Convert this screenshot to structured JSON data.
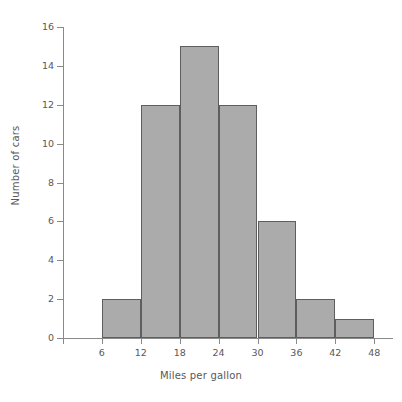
{
  "chart_data": {
    "type": "bar",
    "title": "",
    "subtitle": "",
    "xlabel": "Miles per gallon",
    "ylabel": "Number of cars",
    "bin_edges": [
      6,
      12,
      18,
      24,
      30,
      36,
      42,
      48
    ],
    "categories": [
      "6-12",
      "12-18",
      "18-24",
      "24-30",
      "30-36",
      "36-42",
      "42-48"
    ],
    "values": [
      2,
      12,
      15,
      12,
      6,
      2,
      1
    ],
    "bar_color": "#ababab",
    "bar_edge_color": "#5e5e5e",
    "axis_color": "#8a8a8a",
    "text_color": "#58585a",
    "background": "#ffffff",
    "grid": false,
    "legend": null,
    "xlim": [
      0,
      48
    ],
    "ylim": [
      0,
      16
    ],
    "xticks": [
      "6",
      "12",
      "18",
      "24",
      "30",
      "36",
      "42",
      "48"
    ],
    "xtick_values": [
      6,
      12,
      18,
      24,
      30,
      36,
      42,
      48
    ],
    "yticks": [
      "0",
      "2",
      "4",
      "6",
      "8",
      "10",
      "12",
      "14",
      "16"
    ],
    "ytick_values": [
      0,
      2,
      4,
      6,
      8,
      10,
      12,
      14,
      16
    ]
  }
}
